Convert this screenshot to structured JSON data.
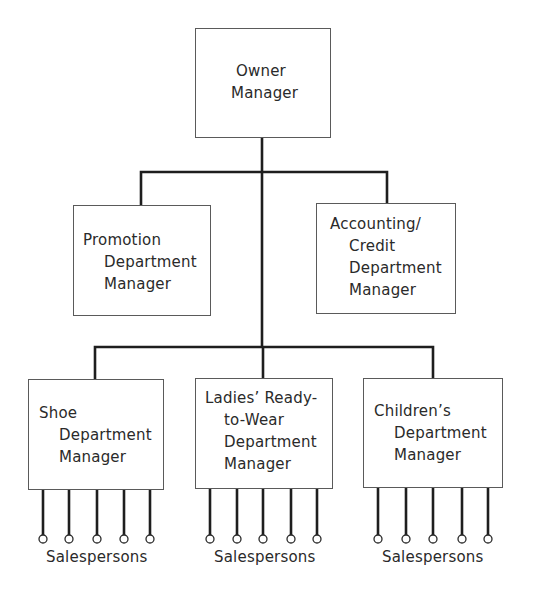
{
  "diagram": {
    "type": "organization-chart",
    "nodes": {
      "owner": {
        "lines": [
          "Owner",
          "Manager"
        ]
      },
      "promotion": {
        "lines": [
          "Promotion",
          "Department",
          "Manager"
        ]
      },
      "accounting": {
        "lines": [
          "Accounting/",
          "Credit",
          "Department",
          "Manager"
        ]
      },
      "shoe": {
        "lines": [
          "Shoe",
          "Department",
          "Manager"
        ],
        "salespersons_label": "Salespersons",
        "salespersons_count": 5
      },
      "ladies": {
        "lines": [
          "Ladies’ Ready-",
          "to-Wear",
          "Department",
          "Manager"
        ],
        "salespersons_label": "Salespersons",
        "salespersons_count": 5
      },
      "childrens": {
        "lines": [
          "Children’s",
          "Department",
          "Manager"
        ],
        "salespersons_label": "Salespersons",
        "salespersons_count": 5
      }
    },
    "edges": [
      [
        "owner",
        "promotion"
      ],
      [
        "owner",
        "accounting"
      ],
      [
        "owner",
        "shoe"
      ],
      [
        "owner",
        "ladies"
      ],
      [
        "owner",
        "childrens"
      ]
    ],
    "colors": {
      "line": "#1e1e1e",
      "box_border": "#5a5a5a",
      "text": "#2a2a2a"
    }
  }
}
